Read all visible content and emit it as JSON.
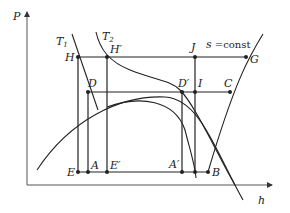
{
  "diagram": {
    "axes": {
      "y_label": "P",
      "x_label": "h"
    },
    "curves": {
      "T1": {
        "label": "T",
        "subscript": "1"
      },
      "T2": {
        "label": "T",
        "subscript": "2"
      },
      "s_const": {
        "label": "s",
        "rest": " =const"
      }
    },
    "points": {
      "H": "H",
      "H_prime": "H′",
      "J": "J",
      "G": "G",
      "D": "D",
      "D_prime": "D′",
      "I": "I",
      "C": "C",
      "E": "E",
      "A": "A",
      "E_prime": "E′",
      "A_prime": "A′",
      "B": "B"
    },
    "colors": {
      "line": "#222222",
      "axis": "#555555"
    }
  }
}
